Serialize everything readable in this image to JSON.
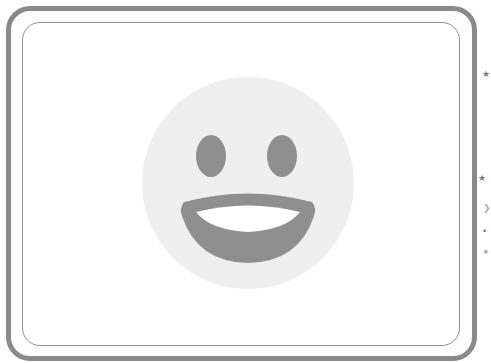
{
  "card": {
    "outer_border_color": "#8a8a8a",
    "inner_border_color": "#8f8f8f",
    "background": "#ffffff"
  },
  "emoji": {
    "name": "grinning-face",
    "face_color": "#efefef",
    "feature_color": "#8f8f8f",
    "teeth_color": "#ffffff"
  },
  "margin_marks": [
    {
      "glyph": "★",
      "x": 483,
      "y": 72
    },
    {
      "glyph": "★",
      "x": 478,
      "y": 176
    },
    {
      "glyph": "❯",
      "x": 483,
      "y": 206
    },
    {
      "glyph": "•",
      "x": 482,
      "y": 229
    },
    {
      "glyph": "✦",
      "x": 482,
      "y": 250
    }
  ]
}
